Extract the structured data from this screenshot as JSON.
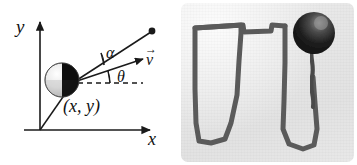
{
  "figure": {
    "kind": "physics-figure",
    "panels": [
      "diagram",
      "photograph"
    ]
  },
  "diagram": {
    "axes": {
      "y_label": "y",
      "x_label": "x",
      "origin_marker": "origin"
    },
    "labels": {
      "coordinates": "(x, y)",
      "alpha_angle": "α",
      "theta_angle": "θ",
      "velocity_vector": "v",
      "velocity_vector_arrow": "→"
    },
    "elements": {
      "ball_name": "two-tone-sphere",
      "position_vector_name": "position-vector",
      "velocity_arrow_name": "velocity-arrow",
      "upper_line_name": "upper-line",
      "upper_line_endpoint_name": "endpoint-dot",
      "dashed_reference_name": "horizontal-dashed-reference"
    },
    "colors": {
      "ink": "#1a1a1a",
      "ball_dark": "#0d0d0d",
      "ball_light": "#f2f2f2",
      "ball_mid": "#9a9a9a"
    }
  },
  "photograph": {
    "description": "long-exposure trajectory of a swinging ball",
    "ball_name": "photo-ball",
    "string_name": "photo-string",
    "trace_name": "photo-trajectory-trace",
    "colors": {
      "background": "#e8e8e8",
      "trace": "#4a4a4a",
      "ball_dark": "#1b1b1b"
    }
  }
}
